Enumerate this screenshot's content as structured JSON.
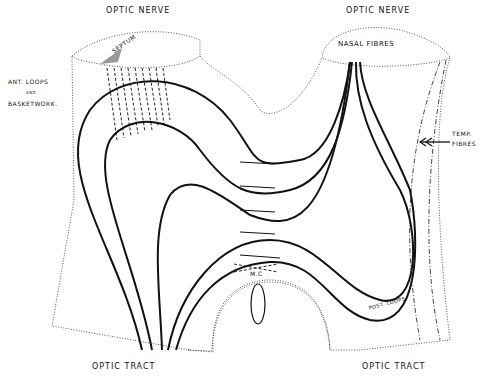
{
  "diagram": {
    "labels": {
      "optic_nerve_left": "OPTIC NERVE",
      "optic_nerve_right": "OPTIC NERVE",
      "septum": "SEPTUM",
      "nasal_fibres": "NASAL FIBRES",
      "ant_loops_1": "ANT. LOOPS",
      "ant_loops_2": "AND",
      "ant_loops_3": "BASKETWORK.",
      "temp_fibres_1": "TEMP.",
      "temp_fibres_2": "FIBRES",
      "mc": "M.C",
      "post_loops": "POST. LOOPS",
      "optic_tract_left": "OPTIC TRACT",
      "optic_tract_right": "OPTIC TRACT"
    }
  }
}
